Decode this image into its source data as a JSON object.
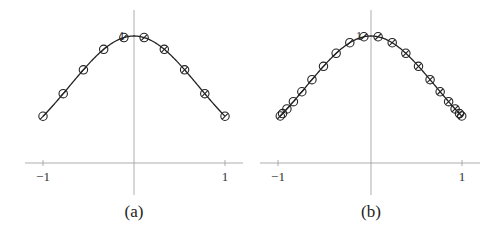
{
  "chart_data": [
    {
      "type": "line",
      "title": "",
      "caption": "(a)",
      "xlabel": "",
      "ylabel": "",
      "xlim": [
        -1.15,
        1.15
      ],
      "ylim": [
        0,
        1.05
      ],
      "grid": false,
      "x_tick_labels": [
        "−1",
        "1"
      ],
      "y_tick_labels": [
        "1"
      ],
      "function": "exp(-x^2)",
      "series": [
        {
          "name": "interpolation nodes (equispaced)",
          "marker": "circle",
          "x": [
            -1,
            -0.778,
            -0.556,
            -0.333,
            -0.111,
            0.111,
            0.333,
            0.556,
            0.778,
            1
          ],
          "y": [
            0.368,
            0.546,
            0.734,
            0.895,
            0.988,
            0.988,
            0.895,
            0.734,
            0.546,
            0.368
          ]
        }
      ]
    },
    {
      "type": "line",
      "title": "",
      "caption": "(b)",
      "xlabel": "",
      "ylabel": "",
      "xlim": [
        -1.15,
        1.15
      ],
      "ylim": [
        0,
        1.05
      ],
      "grid": false,
      "x_tick_labels": [
        "−1",
        "1"
      ],
      "y_tick_labels": [
        "1"
      ],
      "function": "exp(-x^2)",
      "series": [
        {
          "name": "interpolation nodes (Chebyshev)",
          "marker": "circle",
          "x": [
            -0.997,
            -0.972,
            -0.924,
            -0.853,
            -0.76,
            -0.649,
            -0.522,
            -0.383,
            -0.233,
            -0.078,
            0.078,
            0.233,
            0.383,
            0.522,
            0.649,
            0.76,
            0.853,
            0.924,
            0.972,
            0.997
          ],
          "y": [
            0.37,
            0.389,
            0.426,
            0.483,
            0.561,
            0.656,
            0.761,
            0.864,
            0.947,
            0.994,
            0.994,
            0.947,
            0.864,
            0.761,
            0.656,
            0.561,
            0.483,
            0.426,
            0.389,
            0.37
          ]
        }
      ]
    }
  ]
}
